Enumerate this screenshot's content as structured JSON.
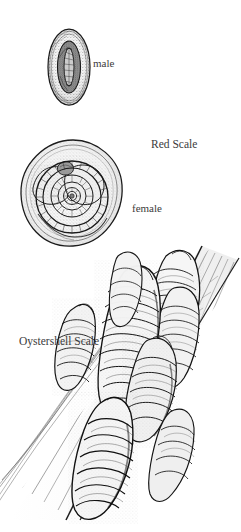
{
  "plate": {
    "title": "Scale Insect Identification Plate",
    "background_color": "#ffffff",
    "ink_color": "#1a1a1a",
    "text_color": "#3b3b3b",
    "width": 241,
    "height": 532,
    "medium": "pen-and-ink stipple illustration"
  },
  "labels": {
    "male": "male",
    "red_scale": "Red Scale",
    "female": "female",
    "oystershell_scale": "Oystershell Scale"
  },
  "figures": [
    {
      "id": "red-scale-male",
      "name": "red-scale-male-figure",
      "caption": "male",
      "group": "Red Scale",
      "shape": "elliptical scale cover with elongated dark central ridge"
    },
    {
      "id": "red-scale-female",
      "name": "red-scale-female-figure",
      "caption": "female",
      "group": "Red Scale",
      "shape": "circular scale cover with concentric spiral rings and offset nipple"
    },
    {
      "id": "oystershell-scale",
      "name": "oystershell-scale-figure",
      "caption": "Oystershell Scale",
      "group": "Oystershell Scale",
      "shape": "clustered elongated mussel-shaped scales encrusting a diagonal twig"
    }
  ]
}
